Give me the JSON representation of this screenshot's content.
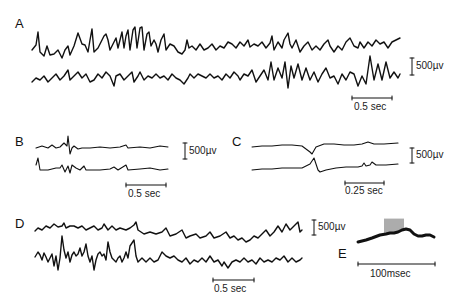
{
  "figure": {
    "panels": [
      {
        "id": "A",
        "label": "A",
        "traces": 2,
        "voltage_cal": "500µv",
        "time_cal": "0.5 sec"
      },
      {
        "id": "B",
        "label": "B",
        "traces": 2,
        "voltage_cal": "500µv",
        "time_cal": "0.5 sec"
      },
      {
        "id": "C",
        "label": "C",
        "traces": 2,
        "voltage_cal": "500µv",
        "time_cal": "0.25 sec"
      },
      {
        "id": "D",
        "label": "D",
        "traces": 2,
        "voltage_cal": "500µv",
        "time_cal": "0.5 sec"
      },
      {
        "id": "E",
        "label": "E",
        "traces": 1,
        "voltage_cal": "",
        "time_cal": "100msec"
      }
    ]
  },
  "colors": {
    "ink": "#111111",
    "background": "#ffffff"
  }
}
